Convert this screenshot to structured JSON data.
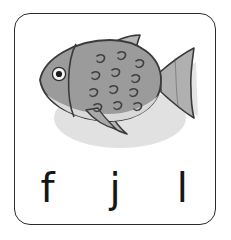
{
  "card": {
    "name": "phonics-flashcard",
    "background_color": "#ffffff",
    "border_color": "#2b2b2b",
    "border_radius_px": 16
  },
  "illustration": {
    "subject": "fish",
    "icon_name": "fish-illustration",
    "style": "hand-drawn cartoon, grayscale",
    "colors": {
      "body_fill": "#9b9b9b",
      "body_shade": "#8d8d8d",
      "belly_fill": "#d8d8d8",
      "fin_fill": "#b4b4b4",
      "outline": "#3a3a3a",
      "eye_outer": "#f2f2f2",
      "eye_pupil": "#1d1d1d",
      "shadow": "#c4c4c4"
    },
    "parts": [
      "body",
      "belly-highlight",
      "dorsal-fin",
      "pectoral-fin",
      "pelvic-fin",
      "tail-fin",
      "gill-line",
      "eye",
      "scale-marks"
    ],
    "scale_mark_count": 12
  },
  "letters": {
    "heading_visible": false,
    "options": [
      {
        "label": "f",
        "name": "letter-option-f"
      },
      {
        "label": "j",
        "name": "letter-option-j"
      },
      {
        "label": "l",
        "name": "letter-option-l"
      }
    ]
  }
}
